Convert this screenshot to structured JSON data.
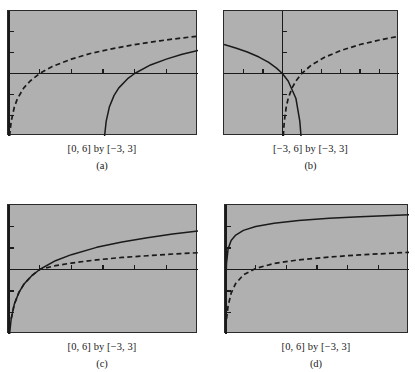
{
  "figure": {
    "background_color": "#ffffff",
    "panel_fill_color": "#b0b0b0",
    "curve_color": "#1a1a1a",
    "frame_color": "#2a2a2a"
  },
  "panels": [
    {
      "id": "a",
      "caption": "[0, 6] by [−3, 3]",
      "sublabel": "(a)",
      "window": {
        "xmin": 0,
        "xmax": 6,
        "ymin": -3,
        "ymax": 3
      },
      "box": {
        "left": 7,
        "top": 10,
        "width": 190,
        "height": 125
      },
      "axes": {
        "x_axis_y_value": 0,
        "y_axis_x_value": 0,
        "x_tick_step": 1,
        "y_tick_step": 1
      },
      "chart_data": {
        "type": "line",
        "title": "",
        "xlabel": "",
        "ylabel": "",
        "xlim": [
          0,
          6
        ],
        "ylim": [
          -3,
          3
        ],
        "grid": false,
        "legend": "none",
        "series": [
          {
            "name": "dashed-log-curve",
            "style": "dashed",
            "expression": "y = ln(x)",
            "x": [
              0.05,
              0.1,
              0.2,
              0.3,
              0.5,
              0.7,
              1.0,
              1.4,
              2.0,
              2.6,
              3.2,
              4.0,
              4.8,
              5.4,
              6.0
            ],
            "y": [
              -3.0,
              -2.3,
              -1.61,
              -1.2,
              -0.69,
              -0.36,
              0.0,
              0.34,
              0.69,
              0.96,
              1.16,
              1.39,
              1.57,
              1.69,
              1.79
            ]
          },
          {
            "name": "solid-log-curve",
            "style": "solid",
            "expression": "y = ln(x − 3)",
            "x": [
              3.05,
              3.1,
              3.2,
              3.35,
              3.5,
              3.8,
              4.0,
              4.5,
              5.0,
              5.5,
              6.0
            ],
            "y": [
              -3.0,
              -2.3,
              -1.61,
              -1.05,
              -0.69,
              -0.22,
              0.0,
              0.41,
              0.69,
              0.92,
              1.1
            ]
          }
        ]
      }
    },
    {
      "id": "b",
      "caption": "[−3, 6] by [−3, 3]",
      "sublabel": "(b)",
      "window": {
        "xmin": -3,
        "xmax": 6,
        "ymin": -3,
        "ymax": 3
      },
      "box": {
        "left": 223,
        "top": 10,
        "width": 175,
        "height": 125
      },
      "axes": {
        "x_axis_y_value": 0,
        "y_axis_x_value": 0,
        "x_tick_step": 1,
        "y_tick_step": 1
      },
      "chart_data": {
        "type": "line",
        "title": "",
        "xlabel": "",
        "ylabel": "",
        "xlim": [
          -3,
          6
        ],
        "ylim": [
          -3,
          3
        ],
        "grid": false,
        "legend": "none",
        "series": [
          {
            "name": "dashed-log-curve",
            "style": "dashed",
            "expression": "y = ln(x)",
            "x": [
              0.05,
              0.1,
              0.2,
              0.3,
              0.5,
              0.7,
              1.0,
              1.5,
              2.2,
              3.0,
              4.0,
              5.0,
              6.0
            ],
            "y": [
              -3.0,
              -2.3,
              -1.61,
              -1.2,
              -0.69,
              -0.36,
              0.0,
              0.41,
              0.79,
              1.1,
              1.39,
              1.61,
              1.79
            ]
          },
          {
            "name": "solid-reflected-log-curve",
            "style": "solid",
            "expression": "y = ln(−x + 1) reflected",
            "x": [
              -3.0,
              -2.4,
              -1.8,
              -1.2,
              -0.7,
              -0.3,
              0.0,
              0.3,
              0.7,
              0.9,
              0.96,
              0.99
            ],
            "y": [
              1.39,
              1.22,
              1.03,
              0.79,
              0.53,
              0.26,
              0.0,
              -0.36,
              -1.2,
              -2.3,
              -3.0,
              -3.0
            ]
          }
        ]
      }
    },
    {
      "id": "c",
      "caption": "[0, 6] by [−3, 3]",
      "sublabel": "(c)",
      "window": {
        "xmin": 0,
        "xmax": 6,
        "ymin": -3,
        "ymax": 3
      },
      "box": {
        "left": 7,
        "top": 204,
        "width": 190,
        "height": 129
      },
      "axes": {
        "x_axis_y_value": 0,
        "y_axis_x_value": 0,
        "x_tick_step": 1,
        "y_tick_step": 1
      },
      "chart_data": {
        "type": "line",
        "title": "",
        "xlabel": "",
        "ylabel": "",
        "xlim": [
          0,
          6
        ],
        "ylim": [
          -3,
          3
        ],
        "grid": false,
        "legend": "none",
        "series": [
          {
            "name": "solid-log-curve",
            "style": "solid",
            "expression": "y = ln(x)",
            "x": [
              0.05,
              0.1,
              0.2,
              0.35,
              0.5,
              0.75,
              1.0,
              1.5,
              2.0,
              2.8,
              3.6,
              4.4,
              5.2,
              6.0
            ],
            "y": [
              -3.0,
              -2.3,
              -1.61,
              -1.05,
              -0.69,
              -0.29,
              0.0,
              0.41,
              0.69,
              1.03,
              1.28,
              1.48,
              1.65,
              1.79
            ]
          },
          {
            "name": "dashed-log-base10-curve",
            "style": "dashed",
            "expression": "y = log₁₀(x) scaled",
            "x": [
              0.1,
              0.2,
              0.35,
              0.5,
              0.75,
              1.0,
              1.5,
              2.0,
              2.8,
              3.6,
              4.4,
              5.2,
              6.0
            ],
            "y": [
              -2.3,
              -1.61,
              -1.05,
              -0.69,
              -0.29,
              0.0,
              0.18,
              0.3,
              0.45,
              0.56,
              0.64,
              0.72,
              0.78
            ]
          }
        ]
      }
    },
    {
      "id": "d",
      "caption": "[0, 6] by [−3, 3]",
      "sublabel": "(d)",
      "window": {
        "xmin": 0,
        "xmax": 6,
        "ymin": -3,
        "ymax": 3
      },
      "box": {
        "left": 224,
        "top": 204,
        "width": 184,
        "height": 129
      },
      "axes": {
        "x_axis_y_value": 0,
        "y_axis_x_value": 0,
        "x_tick_step": 1,
        "y_tick_step": 1
      },
      "chart_data": {
        "type": "line",
        "title": "",
        "xlabel": "",
        "ylabel": "",
        "xlim": [
          0,
          6
        ],
        "ylim": [
          -3,
          3
        ],
        "grid": false,
        "legend": "none",
        "series": [
          {
            "name": "solid-steep-log-curve",
            "style": "solid",
            "expression": "y = 2 + ln(x)/2 steep",
            "x": [
              0.02,
              0.05,
              0.1,
              0.2,
              0.35,
              0.6,
              1.0,
              1.6,
              2.4,
              3.4,
              4.4,
              5.2,
              6.0
            ],
            "y": [
              -1.0,
              0.3,
              0.95,
              1.35,
              1.6,
              1.82,
              2.0,
              2.15,
              2.28,
              2.38,
              2.45,
              2.5,
              2.55
            ]
          },
          {
            "name": "dashed-lower-log-curve",
            "style": "dashed",
            "expression": "y = ln(x)/2 lower",
            "x": [
              0.05,
              0.1,
              0.2,
              0.35,
              0.6,
              1.0,
              1.6,
              2.4,
              3.4,
              4.4,
              5.2,
              6.0
            ],
            "y": [
              -2.3,
              -1.7,
              -1.1,
              -0.65,
              -0.25,
              0.05,
              0.28,
              0.45,
              0.58,
              0.68,
              0.74,
              0.8
            ]
          }
        ]
      }
    }
  ]
}
